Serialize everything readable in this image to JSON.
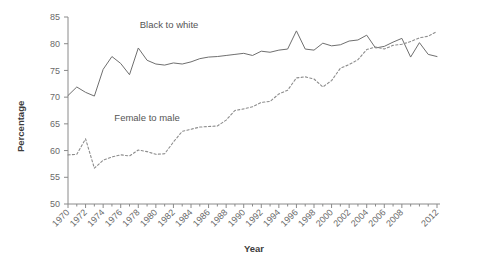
{
  "chart_data": {
    "type": "line",
    "title": "",
    "xlabel": "Year",
    "ylabel": "Percentage",
    "xlim": [
      1970,
      2012
    ],
    "ylim": [
      50,
      85
    ],
    "yticks": [
      50,
      55,
      60,
      65,
      70,
      75,
      80,
      85
    ],
    "xticks": [
      1970,
      1972,
      1974,
      1976,
      1978,
      1980,
      1982,
      1984,
      1986,
      1988,
      1990,
      1992,
      1994,
      1996,
      1998,
      2000,
      2002,
      2004,
      2006,
      2008,
      2012
    ],
    "grid": false,
    "legend_position": "inline-annotations",
    "x": [
      1970,
      1971,
      1972,
      1973,
      1974,
      1975,
      1976,
      1977,
      1978,
      1979,
      1980,
      1981,
      1982,
      1983,
      1984,
      1985,
      1986,
      1987,
      1988,
      1989,
      1990,
      1991,
      1992,
      1993,
      1994,
      1995,
      1996,
      1997,
      1998,
      1999,
      2000,
      2001,
      2002,
      2003,
      2004,
      2005,
      2006,
      2007,
      2008,
      2009,
      2010,
      2011,
      2012
    ],
    "series": [
      {
        "name": "Black to white",
        "style": "solid",
        "values": [
          70.3,
          71.9,
          70.9,
          70.2,
          75.2,
          77.6,
          76.3,
          74.2,
          79.2,
          76.9,
          76.2,
          76.0,
          76.4,
          76.2,
          76.6,
          77.2,
          77.5,
          77.6,
          77.8,
          78.0,
          78.2,
          77.8,
          78.6,
          78.4,
          78.8,
          79.0,
          82.4,
          79.0,
          78.8,
          80.1,
          79.6,
          79.8,
          80.5,
          80.7,
          81.6,
          79.2,
          79.5,
          80.3,
          81.0,
          77.5,
          80.2,
          78.0,
          77.6
        ]
      },
      {
        "name": "Female to male",
        "style": "dashed",
        "values": [
          59.2,
          59.3,
          62.2,
          56.7,
          58.2,
          58.8,
          59.2,
          59.0,
          60.1,
          59.8,
          59.3,
          59.4,
          61.6,
          63.6,
          64.0,
          64.4,
          64.5,
          64.6,
          65.7,
          67.5,
          67.8,
          68.2,
          69.0,
          69.2,
          70.6,
          71.3,
          73.6,
          73.8,
          73.4,
          71.9,
          73.1,
          75.4,
          76.1,
          77.0,
          78.9,
          79.4,
          79.0,
          79.7,
          79.9,
          80.4,
          81.1,
          81.4,
          82.3
        ]
      }
    ],
    "annotations": [
      {
        "text": "Black to white",
        "x": 1981.5,
        "y": 83.0
      },
      {
        "text": "Female to male",
        "x": 1979.0,
        "y": 65.6
      }
    ]
  },
  "axis": {
    "y_title": "Percentage",
    "x_title": "Year",
    "y_tick_labels": [
      "85",
      "80",
      "75",
      "70",
      "65",
      "60",
      "55",
      "50"
    ],
    "x_tick_labels": [
      "1970",
      "1972",
      "1974",
      "1976",
      "1978",
      "1980",
      "1982",
      "1984",
      "1986",
      "1988",
      "1990",
      "1992",
      "1994",
      "1996",
      "1998",
      "2000",
      "2002",
      "2004",
      "2006",
      "2008",
      "2012"
    ]
  },
  "colors": {
    "solid_series": "#6f6f6f",
    "dashed_series": "#8c8c8c",
    "axis": "#8a8a8a",
    "tick_text": "#6a6a6a",
    "title_text": "#3c3c3c",
    "background": "#ffffff"
  }
}
